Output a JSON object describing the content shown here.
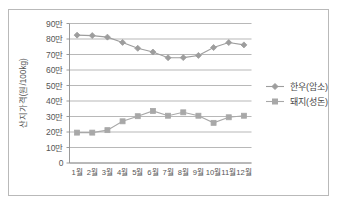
{
  "chart_data": {
    "type": "line",
    "title": "",
    "xlabel": "",
    "ylabel": "산지가격(원/100kg)",
    "categories": [
      "1월",
      "2월",
      "3월",
      "4월",
      "5월",
      "6월",
      "7월",
      "8월",
      "9월",
      "10월",
      "11월",
      "12월"
    ],
    "ylim": [
      0,
      900000
    ],
    "ytick_values": [
      0,
      100000,
      200000,
      300000,
      400000,
      500000,
      600000,
      700000,
      800000,
      900000
    ],
    "ytick_labels": [
      "0",
      "10만",
      "20만",
      "30만",
      "40만",
      "50만",
      "60만",
      "70만",
      "80만",
      "90만"
    ],
    "grid": "horizontal",
    "legend_position": "right",
    "series": [
      {
        "name": "한우(암소)",
        "marker": "diamond",
        "color": "#9d9d9d",
        "values": [
          825000,
          822000,
          812000,
          778000,
          740000,
          716000,
          679000,
          680000,
          694000,
          745000,
          777000,
          762000
        ]
      },
      {
        "name": "돼지(성돈)",
        "marker": "square",
        "color": "#a8a8a8",
        "values": [
          196000,
          196000,
          212000,
          269000,
          302000,
          336000,
          305000,
          327000,
          305000,
          259000,
          295000,
          305000
        ]
      }
    ]
  },
  "legend": {
    "items": [
      {
        "label": "한우(암소)"
      },
      {
        "label": "돼지(성돈)"
      }
    ]
  },
  "axes": {
    "y_title": "산지가격(원/100kg)"
  }
}
